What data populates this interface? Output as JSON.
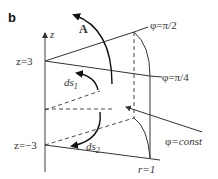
{
  "panel_label": "b",
  "axis": {
    "name": "z",
    "z_top": "z=3",
    "z_bottom": "z=−3"
  },
  "vectors": {
    "A": "A",
    "ds1": "ds",
    "ds1_sub": "1",
    "ds2": "ds",
    "ds2_sub": "2"
  },
  "surfaces": {
    "phi_pi_2": "φ=π/2",
    "phi_pi_4": "φ=π/4",
    "phi_const_symbol": "φ",
    "phi_const_rest": "=const",
    "radius": "r=1"
  }
}
